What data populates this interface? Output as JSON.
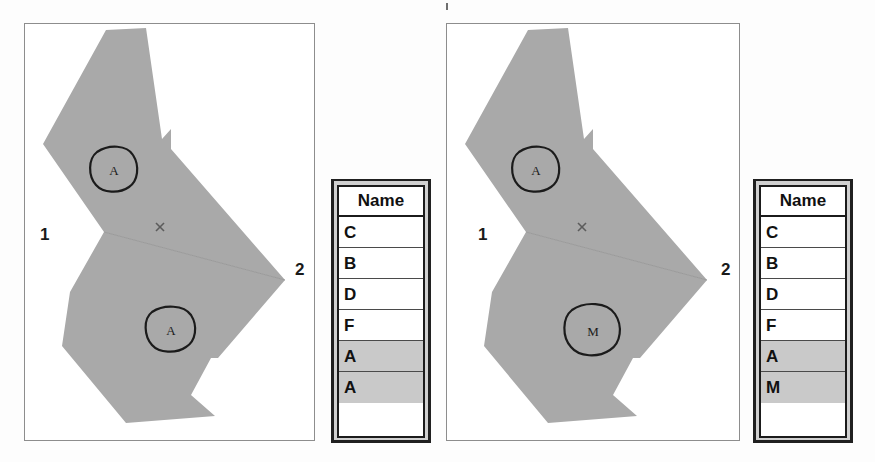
{
  "figure": {
    "panels": [
      {
        "id": "before",
        "map": {
          "node_labels": [
            {
              "name": "node-label-1",
              "text": "1"
            },
            {
              "name": "node-label-2",
              "text": "2"
            }
          ],
          "vertex_marker": "x",
          "annotations": [
            {
              "name": "upper-parcel-annotation",
              "text": "A"
            },
            {
              "name": "lower-parcel-annotation",
              "text": "A"
            }
          ],
          "fill_color": "#a9a9a9",
          "edge_color": "#9a9a9a"
        },
        "table": {
          "header": "Name",
          "column": "Name",
          "rows": [
            {
              "value": "C",
              "selected": false
            },
            {
              "value": "B",
              "selected": false
            },
            {
              "value": "D",
              "selected": false
            },
            {
              "value": "F",
              "selected": false
            },
            {
              "value": "A",
              "selected": true
            },
            {
              "value": "A",
              "selected": true
            }
          ],
          "selected_color": "#c9c9c9",
          "row_color": "#ffffff"
        }
      },
      {
        "id": "after",
        "map": {
          "node_labels": [
            {
              "name": "node-label-1",
              "text": "1"
            },
            {
              "name": "node-label-2",
              "text": "2"
            }
          ],
          "vertex_marker": "x",
          "annotations": [
            {
              "name": "upper-parcel-annotation",
              "text": "A"
            },
            {
              "name": "lower-parcel-annotation",
              "text": "M"
            }
          ],
          "fill_color": "#a9a9a9",
          "edge_color": "#9a9a9a"
        },
        "table": {
          "header": "Name",
          "column": "Name",
          "rows": [
            {
              "value": "C",
              "selected": false
            },
            {
              "value": "B",
              "selected": false
            },
            {
              "value": "D",
              "selected": false
            },
            {
              "value": "F",
              "selected": false
            },
            {
              "value": "A",
              "selected": true
            },
            {
              "value": "M",
              "selected": true
            }
          ],
          "selected_color": "#c9c9c9",
          "row_color": "#ffffff"
        }
      }
    ]
  }
}
